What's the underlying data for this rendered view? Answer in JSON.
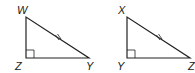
{
  "diagram": {
    "type": "congruent right triangles",
    "triangles": [
      {
        "name": "triangle-WZY",
        "vertices": {
          "top": {
            "label": "W",
            "x": 26,
            "y": 17
          },
          "right_angle": {
            "label": "Z",
            "x": 26,
            "y": 58
          },
          "right": {
            "label": "Y",
            "x": 89,
            "y": 58
          }
        },
        "right_angle_at": "Z",
        "hypotenuse_marked": "WY",
        "tick_marks": 2
      },
      {
        "name": "triangle-XYZ",
        "vertices": {
          "top": {
            "label": "X",
            "x": 127,
            "y": 17
          },
          "right_angle": {
            "label": "Y",
            "x": 127,
            "y": 58
          },
          "right": {
            "label": "Z",
            "x": 190,
            "y": 58
          }
        },
        "right_angle_at": "Y",
        "hypotenuse_marked": "XZ",
        "tick_marks": 2
      }
    ],
    "colors": {
      "stroke": "#222222",
      "background": "#ffffff"
    }
  }
}
